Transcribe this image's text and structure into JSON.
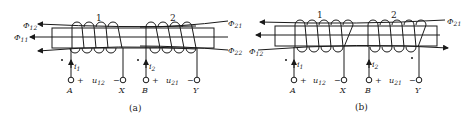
{
  "figure": {
    "panels": [
      {
        "id": "a",
        "caption": "(a)",
        "coil1_label": "1",
        "coil2_label": "2",
        "flux_labels": {
          "phi12": {
            "base": "Φ",
            "sub": "12"
          },
          "phi11": {
            "base": "Φ",
            "sub": "11"
          },
          "phi21": {
            "base": "Φ",
            "sub": "21"
          },
          "phi22": {
            "base": "Φ",
            "sub": "22"
          }
        },
        "terminals": {
          "A": "A",
          "X": "X",
          "B": "B",
          "Y": "Y"
        },
        "currents": {
          "i1": {
            "base": "i",
            "sub": "1"
          },
          "i2": {
            "base": "i",
            "sub": "2"
          }
        },
        "voltages": {
          "u12": {
            "base": "u",
            "sub": "12"
          },
          "u21": {
            "base": "u",
            "sub": "21"
          }
        },
        "polarity": {
          "plus": "+",
          "minus": "−"
        }
      },
      {
        "id": "b",
        "caption": "(b)",
        "coil1_label": "1",
        "coil2_label": "2",
        "flux_labels": {
          "phi12": {
            "base": "Φ",
            "sub": "12"
          },
          "phi21": {
            "base": "Φ",
            "sub": "21"
          }
        },
        "terminals": {
          "A": "A",
          "X": "X",
          "B": "B",
          "Y": "Y"
        },
        "currents": {
          "i1": {
            "base": "i",
            "sub": "1"
          },
          "i2": {
            "base": "i",
            "sub": "2"
          }
        },
        "voltages": {
          "u12": {
            "base": "u",
            "sub": "12"
          },
          "u21": {
            "base": "u",
            "sub": "21"
          }
        },
        "polarity": {
          "plus": "+",
          "minus": "−"
        }
      }
    ],
    "colors": {
      "ink": "#1a1a1a",
      "background": "#ffffff"
    }
  }
}
